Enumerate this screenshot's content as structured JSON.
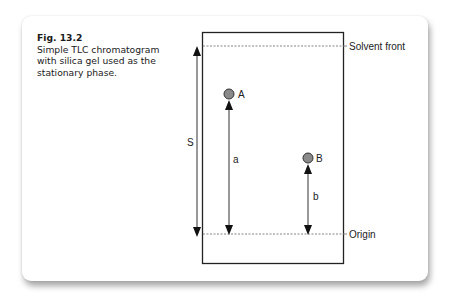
{
  "figure": {
    "number": "Fig. 13.2",
    "caption": "Simple TLC chromatogram with silica gel used as the stationary phase."
  },
  "diagram": {
    "labels": {
      "solvent_front": "Solvent front",
      "origin": "Origin",
      "spot_a": "A",
      "spot_b": "B",
      "distance_s": "S",
      "distance_a": "a",
      "distance_b": "b"
    },
    "colors": {
      "spot_fill": "#8a8a8a",
      "line": "#222222",
      "dashed": "#777777"
    }
  }
}
